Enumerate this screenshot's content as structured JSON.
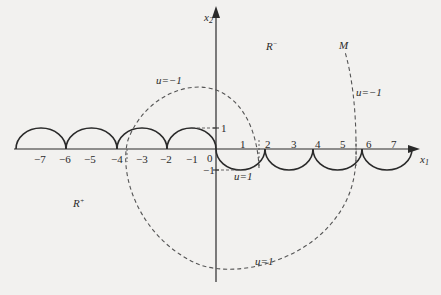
{
  "diagram": {
    "axes": {
      "x_label": "x",
      "x_label_sub": "1",
      "y_label": "x",
      "y_label_sub": "2"
    },
    "x_ticks": [
      {
        "label": "−7",
        "x": -7
      },
      {
        "label": "−6",
        "x": -6
      },
      {
        "label": "−5",
        "x": -5
      },
      {
        "label": "−4",
        "x": -4
      },
      {
        "label": "−3",
        "x": -3
      },
      {
        "label": "−2",
        "x": -2
      },
      {
        "label": "−1",
        "x": -1
      },
      {
        "label": "0",
        "x": 0
      },
      {
        "label": "1",
        "x": 1
      },
      {
        "label": "2",
        "x": 2
      },
      {
        "label": "3",
        "x": 3
      },
      {
        "label": "4",
        "x": 4
      },
      {
        "label": "5",
        "x": 5
      },
      {
        "label": "6",
        "x": 6
      },
      {
        "label": "7",
        "x": 7
      }
    ],
    "y_ticks": [
      {
        "label": "1",
        "y": 1
      },
      {
        "label": "−1",
        "y": -1
      }
    ],
    "regions": {
      "r_minus": {
        "base": "R",
        "sup": "−"
      },
      "r_plus": {
        "base": "R",
        "sup": "+"
      }
    },
    "curve_labels": {
      "switching_curve": "M",
      "u_minus_inner": "u=−1",
      "u_minus_outer": "u=−1",
      "u_plus_inner": "u=1",
      "u_plus_outer": "u=1"
    },
    "styles": {
      "line_color": "#2a2a2a",
      "dash_color": "#555555",
      "background": "#f2f1ef"
    }
  }
}
